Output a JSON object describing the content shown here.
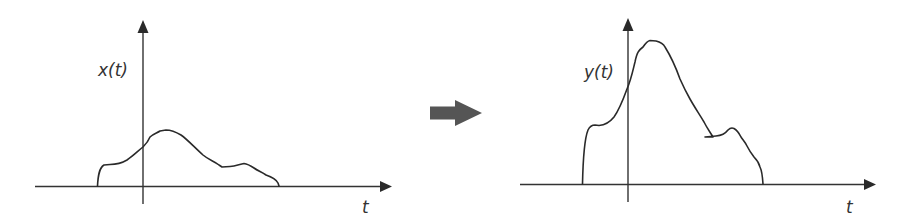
{
  "diagram": {
    "type": "signal-transformation",
    "input_panel": {
      "y_label": "x(t)",
      "x_label": "t",
      "description": "Input signal x(t): starts at small plateau, rises to a moderate broad peak just right of t=0, decays with a small bump before returning to zero"
    },
    "transform_arrow": {
      "direction": "right",
      "color": "#555555"
    },
    "output_panel": {
      "y_label": "y(t)",
      "x_label": "t",
      "description": "Output signal y(t): same support as x(t) but amplified, with a tall peak just right of t=0 and a bump on the decaying tail"
    },
    "colors": {
      "line": "#2a2a2a",
      "axis": "#333333",
      "background": "#ffffff"
    }
  }
}
